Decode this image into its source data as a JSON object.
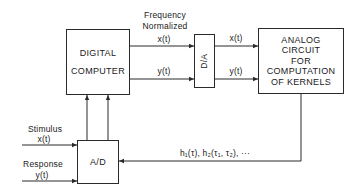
{
  "diagram": {
    "boxes": {
      "digital_computer": [
        "DIGITAL",
        "COMPUTER"
      ],
      "da": "D/A",
      "analog_circuit": [
        "ANALOG",
        "CIRCUIT",
        "FOR",
        "COMPUTATION",
        "OF KERNELS"
      ],
      "ad": "A/D"
    },
    "labels": {
      "freq_line1": "Frequency",
      "freq_line2": "Normalized",
      "dc_x": "x(t)",
      "dc_y": "y(t)",
      "da_x": "x(t)",
      "da_y": "y(t)",
      "stimulus": "Stimulus",
      "stimulus_x": "x(t)",
      "response": "Response",
      "response_y": "y(t)",
      "kernels": "h₁(τ), h₂(τ₁, τ₂), ···"
    }
  }
}
